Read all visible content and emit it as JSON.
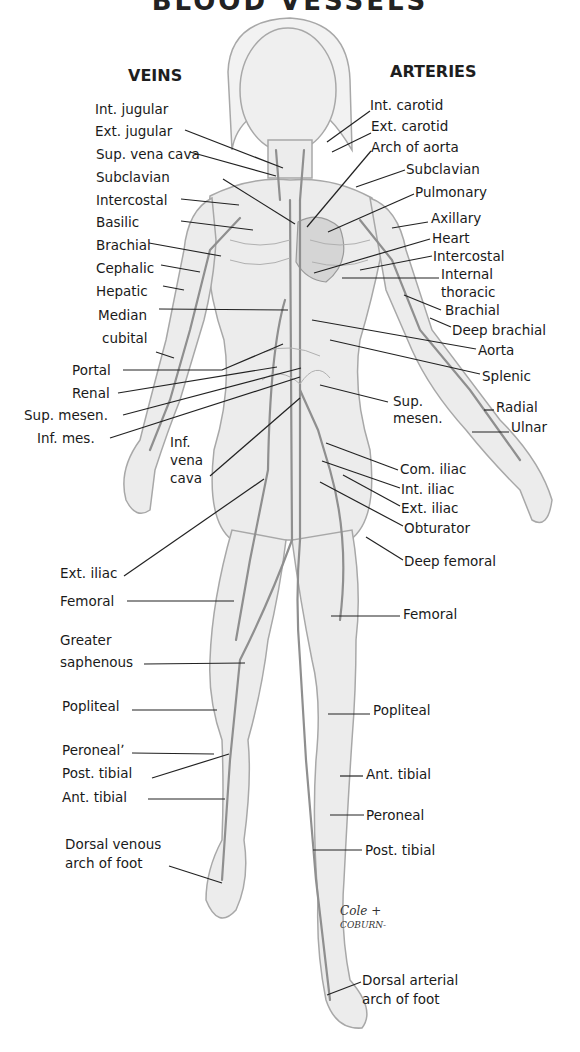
{
  "title": "BLOOD VESSELS",
  "headings": {
    "veins": "VEINS",
    "arteries": "ARTERIES"
  },
  "veins": [
    {
      "label": "Int. jugular",
      "x": 95,
      "y": 109
    },
    {
      "label": "Ext. jugular",
      "x": 95,
      "y": 131
    },
    {
      "label": "Sup. vena cava",
      "x": 96,
      "y": 154
    },
    {
      "label": "Subclavian",
      "x": 96,
      "y": 177
    },
    {
      "label": "Intercostal",
      "x": 96,
      "y": 200
    },
    {
      "label": "Basilic",
      "x": 96,
      "y": 222
    },
    {
      "label": "Brachial",
      "x": 96,
      "y": 245
    },
    {
      "label": "Cephalic",
      "x": 96,
      "y": 268
    },
    {
      "label": "Hepatic",
      "x": 96,
      "y": 291
    },
    {
      "label": "Median",
      "x": 98,
      "y": 315
    },
    {
      "label": "cubital",
      "x": 102,
      "y": 338
    },
    {
      "label": "Portal",
      "x": 72,
      "y": 358
    },
    {
      "label": "Renal",
      "x": 72,
      "y": 382
    },
    {
      "label": "Sup. mesen.",
      "x": 24,
      "y": 404
    },
    {
      "label": "Inf. mes.",
      "x": 37,
      "y": 427
    },
    {
      "label": "Inf.",
      "x": 170,
      "y": 436
    },
    {
      "label": "vena",
      "x": 170,
      "y": 455
    },
    {
      "label": "cava",
      "x": 170,
      "y": 474
    },
    {
      "label": "Ext. iliac",
      "x": 60,
      "y": 565
    },
    {
      "label": "Femoral",
      "x": 60,
      "y": 593
    },
    {
      "label": "Greater",
      "x": 60,
      "y": 632
    },
    {
      "label": "saphenous",
      "x": 60,
      "y": 654
    },
    {
      "label": "Popliteal",
      "x": 62,
      "y": 698
    },
    {
      "label": "Peronealʼ",
      "x": 62,
      "y": 742
    },
    {
      "label": "Post. tibial",
      "x": 62,
      "y": 765
    },
    {
      "label": "Ant. tibial",
      "x": 62,
      "y": 789
    },
    {
      "label": "Dorsal venous",
      "x": 65,
      "y": 836
    },
    {
      "label": "arch of foot",
      "x": 65,
      "y": 855
    }
  ],
  "arteries": [
    {
      "label": "Int. carotid",
      "x": 370,
      "y": 98
    },
    {
      "label": "Ext. carotid",
      "x": 371,
      "y": 120
    },
    {
      "label": "Arch of aorta",
      "x": 371,
      "y": 141
    },
    {
      "label": "Subclavian",
      "x": 406,
      "y": 163
    },
    {
      "label": "Pulmonary",
      "x": 415,
      "y": 186
    },
    {
      "label": "Axillary",
      "x": 431,
      "y": 212
    },
    {
      "label": "Heart",
      "x": 432,
      "y": 232
    },
    {
      "label": "Intercostal",
      "x": 433,
      "y": 250
    },
    {
      "label": "Internal",
      "x": 441,
      "y": 268
    },
    {
      "label": "thoracic",
      "x": 441,
      "y": 285
    },
    {
      "label": "Brachial",
      "x": 445,
      "y": 304
    },
    {
      "label": "Deep brachial",
      "x": 452,
      "y": 324
    },
    {
      "label": "Aorta",
      "x": 478,
      "y": 344
    },
    {
      "label": "Splenic",
      "x": 482,
      "y": 370
    },
    {
      "label": "Sup.",
      "x": 393,
      "y": 394
    },
    {
      "label": "mesen.",
      "x": 393,
      "y": 412
    },
    {
      "label": "Radial",
      "x": 496,
      "y": 400
    },
    {
      "label": "Ulnar",
      "x": 511,
      "y": 420
    },
    {
      "label": "Com. iliac",
      "x": 400,
      "y": 462
    },
    {
      "label": "Int. iliac",
      "x": 401,
      "y": 482
    },
    {
      "label": "Ext. iliac",
      "x": 401,
      "y": 502
    },
    {
      "label": "Obturator",
      "x": 404,
      "y": 522
    },
    {
      "label": "Deep femoral",
      "x": 404,
      "y": 555
    },
    {
      "label": "Femoral",
      "x": 403,
      "y": 604
    },
    {
      "label": "Popliteal",
      "x": 373,
      "y": 702
    },
    {
      "label": "Ant. tibial",
      "x": 366,
      "y": 766
    },
    {
      "label": "Peroneal",
      "x": 366,
      "y": 801
    },
    {
      "label": "Post. tibial",
      "x": 365,
      "y": 838
    },
    {
      "label": "Dorsal arterial",
      "x": 362,
      "y": 972
    },
    {
      "label": "arch of foot",
      "x": 362,
      "y": 991
    }
  ],
  "signature": {
    "line1": "Cole +",
    "line2": "COBURN-"
  },
  "colors": {
    "background": "#ffffff",
    "figure_fill": "#e9e9e9",
    "figure_edge": "#a8a8a8",
    "vessel": "#8f8f8f",
    "leader": "#222222",
    "text": "#1a1a1a"
  }
}
